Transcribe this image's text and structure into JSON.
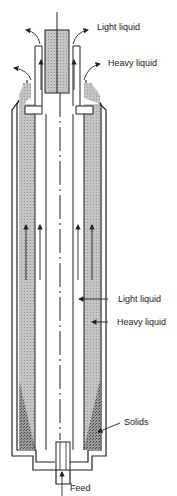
{
  "diagram": {
    "labels": {
      "light_liquid_out": "Light liquid",
      "heavy_liquid_out": "Heavy liquid",
      "light_liquid_zone": "Light liquid",
      "heavy_liquid_zone": "Heavy liquid",
      "solids": "Solids",
      "feed": "Feed"
    },
    "colors": {
      "line": "#222222",
      "heavy_fill": "#bdbdbd",
      "solids_fill": "#7a7a7a",
      "background": "#ffffff"
    }
  }
}
